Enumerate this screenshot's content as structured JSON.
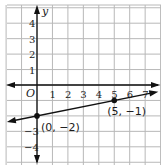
{
  "chart_data": {
    "type": "line",
    "title": "",
    "xlabel": "",
    "ylabel": "y",
    "origin_label": "O",
    "xlim": [
      -2,
      8
    ],
    "ylim": [
      -5.2,
      5.2
    ],
    "grid": true,
    "x_ticks": [
      "1",
      "2",
      "3",
      "4",
      "5",
      "6",
      "7"
    ],
    "y_ticks_positive": [
      "4",
      "3",
      "2",
      "1"
    ],
    "y_ticks_negative": [
      "−3",
      "−4"
    ],
    "series": [
      {
        "name": "line through (0, -2) and (5, -1)",
        "slope": 0.2,
        "intercept": -2,
        "x": [
          -2,
          8
        ],
        "y": [
          -2.4,
          -0.4
        ]
      }
    ],
    "points": [
      {
        "x": 0,
        "y": -2,
        "label": "(0, −2)"
      },
      {
        "x": 5,
        "y": -1,
        "label": "(5, −1)"
      }
    ],
    "colors": {
      "grid": "#b8b8b8",
      "axis": "#111111",
      "line": "#111111"
    }
  }
}
